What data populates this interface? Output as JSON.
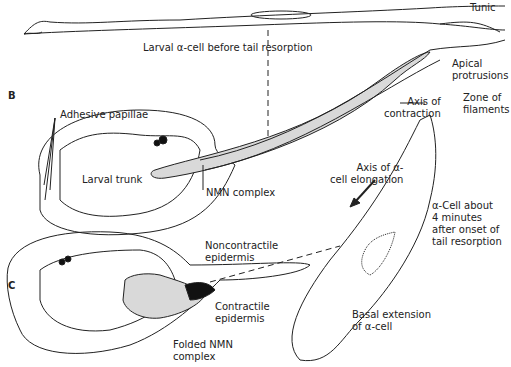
{
  "panels": {
    "b": "B",
    "c": "C"
  },
  "labels": {
    "tunic": "Tunic",
    "larval_alpha_cell": "Larval α-cell before tail resorption",
    "apical_protrusions": "Apical\nprotrusions",
    "axis_of_contraction": "Axis of\ncontraction",
    "zone_of_filaments": "Zone of\nfilaments",
    "adhesive_papillae": "Adhesive papillae",
    "larval_trunk": "Larval trunk",
    "nmn_complex": "NMN complex",
    "axis_of_elongation": "Axis of α-\ncell elongation",
    "alpha_cell_4min": "α-Cell about\n4 minutes\nafter onset of\ntail resorption",
    "noncontractile_epidermis": "Noncontractile\nepidermis",
    "contractile_epidermis": "Contractile\nepidermis",
    "folded_nmn_complex": "Folded NMN\ncomplex",
    "basal_extension": "Basal extension\nof α-cell"
  },
  "colors": {
    "line": "#222222",
    "fill_gray": "#d9d9d9",
    "dark": "#111111"
  }
}
